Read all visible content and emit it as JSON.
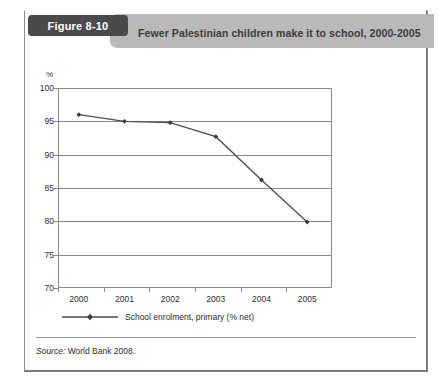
{
  "figure": {
    "tag_label": "Figure 8-10",
    "title": "Fewer Palestinian children make it to school, 2000-2005",
    "source_prefix": "Source:",
    "source_text": "World Bank 2008."
  },
  "colors": {
    "tag_background": "#4a4a4a",
    "header_band": "#b9b9b9",
    "series_line": "#4d4d4d",
    "grid": "#8a8a8a",
    "text": "#2d2d2d"
  },
  "chart_data": {
    "type": "line",
    "title": "Fewer Palestinian children make it to school, 2000-2005",
    "xlabel": "",
    "ylabel": "%",
    "categories": [
      "2000",
      "2001",
      "2002",
      "2003",
      "2004",
      "2005"
    ],
    "x": [
      2000,
      2001,
      2002,
      2003,
      2004,
      2005
    ],
    "series": [
      {
        "name": "School enrolment, primary (% net)",
        "values": [
          96.0,
          95.0,
          94.8,
          92.7,
          86.2,
          79.9
        ]
      }
    ],
    "ylim": [
      70,
      100
    ],
    "yticks": [
      100,
      95,
      90,
      85,
      80,
      75,
      70
    ],
    "ytick_labels": [
      "100",
      "95",
      "90",
      "85",
      "80",
      "75",
      "70"
    ],
    "grid": true,
    "legend_position": "below",
    "legend": [
      "School enrolment, primary (% net)"
    ],
    "marker": "diamond"
  }
}
